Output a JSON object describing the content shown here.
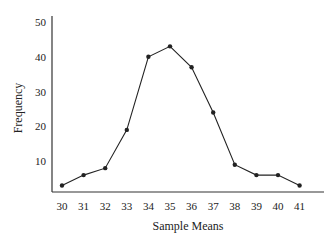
{
  "chart_data": {
    "type": "line",
    "title": "",
    "xlabel": "Sample Means",
    "ylabel": "Frequency",
    "x": [
      30,
      31,
      32,
      33,
      34,
      35,
      36,
      37,
      38,
      39,
      40,
      41
    ],
    "series": [
      {
        "name": "Frequency",
        "values": [
          3,
          6,
          8,
          19,
          40,
          43,
          37,
          24,
          9,
          6,
          6,
          3
        ]
      }
    ],
    "xticks": [
      "30",
      "31",
      "32",
      "33",
      "34",
      "35",
      "36",
      "37",
      "38",
      "39",
      "40",
      "41"
    ],
    "yticks": [
      "10",
      "20",
      "30",
      "40",
      "50"
    ],
    "ylim": [
      0,
      50
    ],
    "xlim": [
      29.5,
      42
    ],
    "grid": false,
    "legend": null,
    "markers": true,
    "colors": {
      "line": "#222222",
      "axis": "#333333"
    }
  }
}
